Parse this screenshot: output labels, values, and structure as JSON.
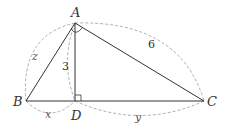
{
  "diagram": {
    "type": "geometry-right-triangle-with-altitude",
    "points": {
      "A": {
        "label": "A",
        "x": 75,
        "y": 23
      },
      "B": {
        "label": "B",
        "x": 26,
        "y": 101
      },
      "C": {
        "label": "C",
        "x": 204,
        "y": 101
      },
      "D": {
        "label": "D",
        "x": 75,
        "y": 101
      }
    },
    "segments": [
      {
        "from": "A",
        "to": "B"
      },
      {
        "from": "A",
        "to": "C"
      },
      {
        "from": "B",
        "to": "C"
      },
      {
        "from": "A",
        "to": "D"
      }
    ],
    "right_angles": [
      "A",
      "D"
    ],
    "measures": {
      "AC": "6",
      "AD": "3",
      "AB": "z",
      "BD": "x",
      "DC": "y"
    },
    "colors": {
      "line": "#333333",
      "dashed": "#999999",
      "background": "#ffffff"
    }
  }
}
